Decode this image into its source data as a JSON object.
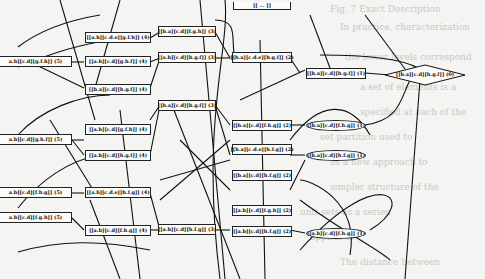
{
  "diagram": {
    "type": "layered partition graph",
    "background_text": [
      "Fig. 7  Exact Description",
      "the lower levels correspond",
      "a set of elements is a",
      "specified at each of the",
      "set partition used to",
      "Scc, computed as",
      "as a new approach to",
      "simpler structure of the",
      "unit sets as a series",
      "applies to",
      "The distance between"
    ],
    "nodes": {
      "l5_1": "a.b][c.d][g.f.h]] (5)",
      "l5_2": "a.b][c.d][g.h.f]] (5)",
      "l5_3": "a.b][c.d][f.h.g]] (5)",
      "l5_4": "a.b][c.d][f.g.h]] (5)",
      "l4_1": "[[a.b][c.d.e][g.f.h]] (4)",
      "l4_2": "[[a.b][c.d][g.h.f]] (4)",
      "l4_3": "[[b.a][c.d][h.g.f]] (4)",
      "l4_4": "[[a.b][c.d][g.f.h]] (4)",
      "l4_5": "[[a.b][c.d][h.g.f]] (4)",
      "l4_6": "[[a.b][c.d.e][h.f.g]] (4)",
      "l4_7": "[[a.b][c.d][f.h.g]] (4)",
      "l3_1": "[[b.a][c.d][f.g.h]] (3)",
      "l3_2": "[[a.b][c.d][h.g.f]] (3)",
      "l3_3": "[[b.a][c.d][h.g.f]] (3)",
      "l3_4": "[[a.b][c.d][h.f.g]] (3)",
      "l2_top": "[[ ... ]]",
      "l2_1": "[[b.a][c.d.e][h.g.f]] (2)",
      "l2_2": "[[b.a][c.d][f.h.g]] (2)",
      "l2_3": "[[b.a][c.d.e][h.f.g]] (2)",
      "l2_4": "[[b.a][c.d][h.f.g]] (2)",
      "l2_5": "[[a.b][c.d][f.g.h]] (2)",
      "l2_6": "[[a.b][c.d][h.f.g]] (2)",
      "l1_1": "[[b.a][c.d][h.g.f]] (1)",
      "l1_2": "[[b.a][c.d][f.h.g]] (1)",
      "l1_3": "[[b.a][c.d][h.f.g]] (1)",
      "l1_4": "[[a.b][c.d][f.h.g]] (1)",
      "root": "[[b.a][c.d][h.g.f]] (0)"
    }
  }
}
